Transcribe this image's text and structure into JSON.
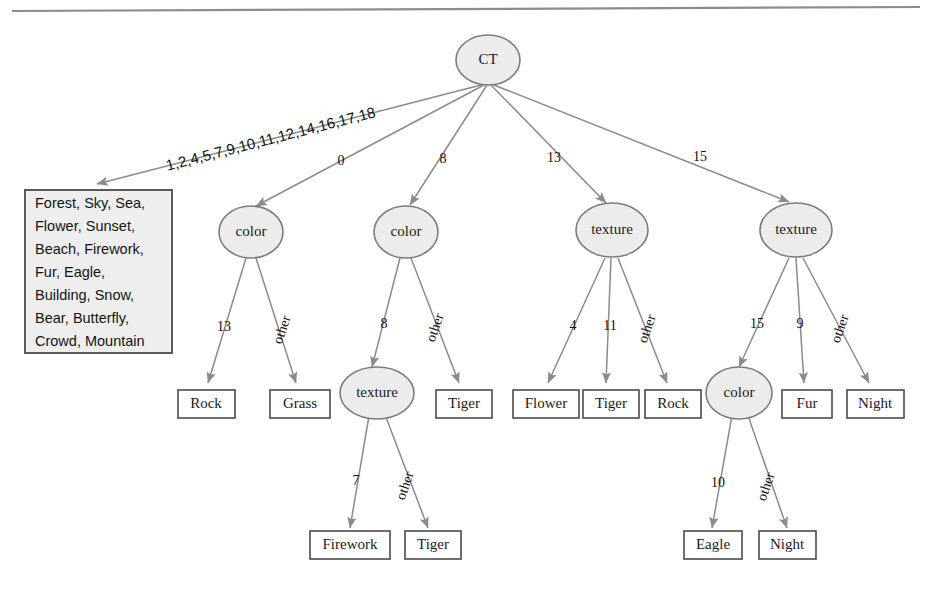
{
  "diagram": {
    "colors": {
      "node_fill": "#ececec",
      "node_stroke": "#7c7c7c",
      "leaf_fill": "#ffffff",
      "leaf_stroke": "#555555",
      "edge_stroke": "#8b8b8b",
      "setbox_fill": "#eeeeee",
      "setbox_stroke": "#5a5a5a",
      "text": "#1a1a1a",
      "page_rule": "#8d8d8d"
    },
    "root": {
      "label": "CT"
    },
    "internal_nodes": [
      {
        "id": "color1",
        "label": "color"
      },
      {
        "id": "color2",
        "label": "color"
      },
      {
        "id": "texture3",
        "label": "texture"
      },
      {
        "id": "texture4",
        "label": "texture"
      },
      {
        "id": "texture2a",
        "label": "texture"
      },
      {
        "id": "color4a",
        "label": "color"
      }
    ],
    "leaves": [
      {
        "id": "rock1",
        "label": "Rock"
      },
      {
        "id": "grass1",
        "label": "Grass"
      },
      {
        "id": "tiger2",
        "label": "Tiger"
      },
      {
        "id": "firework",
        "label": "Firework"
      },
      {
        "id": "tiger2b",
        "label": "Tiger"
      },
      {
        "id": "flower3",
        "label": "Flower"
      },
      {
        "id": "tiger3",
        "label": "Tiger"
      },
      {
        "id": "rock3",
        "label": "Rock"
      },
      {
        "id": "fur4",
        "label": "Fur"
      },
      {
        "id": "night4",
        "label": "Night"
      },
      {
        "id": "eagle",
        "label": "Eagle"
      },
      {
        "id": "night5",
        "label": "Night"
      }
    ],
    "set_box": {
      "lines": [
        "Forest, Sky, Sea,",
        "Flower, Sunset,",
        "Beach, Firework,",
        "Fur, Eagle,",
        "Building, Snow,",
        "Bear, Butterfly,",
        "Crowd, Mountain"
      ]
    },
    "edges": [
      {
        "id": "e-root-setbox",
        "from": "CT",
        "to": "set_box",
        "label": "1,2,4,5,7,9,10,11,12,14,16,17,18"
      },
      {
        "id": "e-root-color1",
        "from": "CT",
        "to": "color1",
        "label": "0"
      },
      {
        "id": "e-root-color2",
        "from": "CT",
        "to": "color2",
        "label": "8"
      },
      {
        "id": "e-root-texture3",
        "from": "CT",
        "to": "texture3",
        "label": "13"
      },
      {
        "id": "e-root-texture4",
        "from": "CT",
        "to": "texture4",
        "label": "15"
      },
      {
        "id": "e-color1-rock",
        "from": "color1",
        "to": "rock1",
        "label": "13"
      },
      {
        "id": "e-color1-grass",
        "from": "color1",
        "to": "grass1",
        "label": "other"
      },
      {
        "id": "e-color2-texture",
        "from": "color2",
        "to": "texture2a",
        "label": "8"
      },
      {
        "id": "e-color2-tiger",
        "from": "color2",
        "to": "tiger2",
        "label": "other"
      },
      {
        "id": "e-texture2a-firework",
        "from": "texture2a",
        "to": "firework",
        "label": "7"
      },
      {
        "id": "e-texture2a-tiger",
        "from": "texture2a",
        "to": "tiger2b",
        "label": "other"
      },
      {
        "id": "e-texture3-flower",
        "from": "texture3",
        "to": "flower3",
        "label": "4"
      },
      {
        "id": "e-texture3-tiger",
        "from": "texture3",
        "to": "tiger3",
        "label": "11"
      },
      {
        "id": "e-texture3-rock",
        "from": "texture3",
        "to": "rock3",
        "label": "other"
      },
      {
        "id": "e-texture4-color",
        "from": "texture4",
        "to": "color4a",
        "label": "15"
      },
      {
        "id": "e-texture4-fur",
        "from": "texture4",
        "to": "fur4",
        "label": "9"
      },
      {
        "id": "e-texture4-night",
        "from": "texture4",
        "to": "night4",
        "label": "other"
      },
      {
        "id": "e-color4a-eagle",
        "from": "color4a",
        "to": "eagle",
        "label": "10"
      },
      {
        "id": "e-color4a-night",
        "from": "color4a",
        "to": "night5",
        "label": "other"
      }
    ]
  }
}
